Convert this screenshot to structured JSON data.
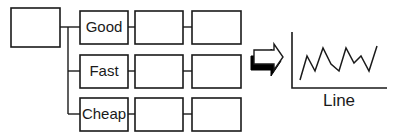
{
  "diagram": {
    "root_box": {
      "x": 11,
      "y": 8,
      "w": 49,
      "h": 39
    },
    "trunk": {
      "x": 68,
      "y_top": 27,
      "y_bottom": 114
    },
    "rows": [
      {
        "label": "Good",
        "y": 11,
        "h": 33,
        "cy": 27
      },
      {
        "label": "Fast",
        "y": 55,
        "h": 33,
        "cy": 71
      },
      {
        "label": "Cheap",
        "y": 98,
        "h": 33,
        "cy": 114
      }
    ],
    "columns": [
      {
        "x": 80,
        "w": 48
      },
      {
        "x": 135,
        "w": 48
      },
      {
        "x": 192,
        "w": 49
      }
    ],
    "arrow": {
      "style": "3d-outline-right-arrow",
      "body_color": "#ffffff",
      "shadow_color": "#000000"
    },
    "chart": {
      "caption": "Line",
      "line_points": [
        [
          300,
          80
        ],
        [
          307,
          56
        ],
        [
          315,
          71
        ],
        [
          323,
          48
        ],
        [
          331,
          64
        ],
        [
          339,
          71
        ],
        [
          346,
          48
        ],
        [
          354,
          63
        ],
        [
          361,
          56
        ],
        [
          369,
          71
        ],
        [
          377,
          46
        ]
      ]
    }
  },
  "chart_data": {
    "type": "line",
    "title": "",
    "xlabel": "Line",
    "ylabel": "",
    "grid": false,
    "legend": "none",
    "x": [
      1,
      2,
      3,
      4,
      5,
      6,
      7,
      8,
      9,
      10,
      11
    ],
    "values": [
      2,
      8,
      4,
      10,
      6,
      4,
      10,
      6,
      8,
      4,
      10
    ],
    "note": "Schematic zig-zag line, no axis ticks; values relative"
  }
}
